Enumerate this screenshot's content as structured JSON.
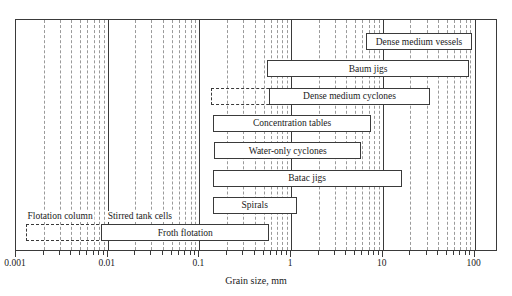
{
  "chart_data": {
    "type": "bar",
    "orientation": "horizontal",
    "title": "",
    "xlabel": "Grain size, mm",
    "ylabel": "",
    "xscale": "log",
    "xlim": [
      0.001,
      200
    ],
    "xticks": [
      0.001,
      0.01,
      0.1,
      1,
      10,
      100
    ],
    "xticklabels": [
      "0.001",
      "0.01",
      "0.1",
      "1",
      "10",
      "100"
    ],
    "grid": true,
    "grid_minor": true,
    "legend": "none",
    "series": [
      {
        "name": "Dense medium vessels",
        "label": "Dense medium vessels",
        "x_min": 6.5,
        "x_max": 95,
        "style": "solid",
        "row": 0
      },
      {
        "name": "Baum jigs",
        "label": "Baum jigs",
        "x_min": 0.55,
        "x_max": 87,
        "style": "solid",
        "row": 1
      },
      {
        "name": "Dense medium cyclones",
        "label": "Dense medium cyclones",
        "x_min": 0.57,
        "x_max": 33,
        "x_min_extended": 0.135,
        "style": "solid+dashed-extension",
        "row": 2
      },
      {
        "name": "Concentration tables",
        "label": "Concentration tables",
        "x_min": 0.14,
        "x_max": 7.5,
        "style": "solid",
        "row": 3
      },
      {
        "name": "Water-only cyclones",
        "label": "Water-only cyclones",
        "x_min": 0.145,
        "x_max": 5.8,
        "style": "solid",
        "row": 4
      },
      {
        "name": "Batac jigs",
        "label": "Batac jigs",
        "x_min": 0.14,
        "x_max": 16,
        "style": "solid",
        "row": 5
      },
      {
        "name": "Spirals",
        "label": "Spirals",
        "x_min": 0.14,
        "x_max": 1.15,
        "style": "solid",
        "row": 6
      },
      {
        "name": "Froth flotation",
        "label": "Froth flotation",
        "x_min": 0.0085,
        "x_max": 0.58,
        "x_min_extended": 0.0013,
        "style": "solid+dashed-extension",
        "row": 7
      }
    ],
    "annotations": [
      {
        "text": "Flotation column",
        "x": 0.0031
      },
      {
        "text": "Stirred tank cells",
        "x": 0.023
      }
    ]
  },
  "axis": {
    "title": "Grain size, mm",
    "ticks": [
      {
        "label": "0.001",
        "value": 0.001
      },
      {
        "label": "0.01",
        "value": 0.01
      },
      {
        "label": "0.1",
        "value": 0.1
      },
      {
        "label": "1",
        "value": 1
      },
      {
        "label": "10",
        "value": 10
      },
      {
        "label": "100",
        "value": 100
      }
    ]
  },
  "colors": {
    "frame": "#3a3a3a",
    "grid_minor": "#9a9a9a",
    "bar_fill": "#ffffff",
    "text": "#1a1a1a",
    "background": "#ffffff"
  }
}
